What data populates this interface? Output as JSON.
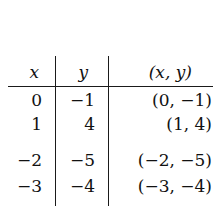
{
  "table": {
    "headers": [
      "x",
      "y",
      "(x, y)"
    ],
    "rows": [
      {
        "x": "0",
        "y": "−1",
        "pair": "(0, −1)"
      },
      {
        "x": "1",
        "y": "4",
        "pair": "(1, 4)"
      },
      {
        "x": "−2",
        "y": "−5",
        "pair": "(−2, −5)"
      },
      {
        "x": "−3",
        "y": "−4",
        "pair": "(−3, −4)"
      }
    ]
  }
}
